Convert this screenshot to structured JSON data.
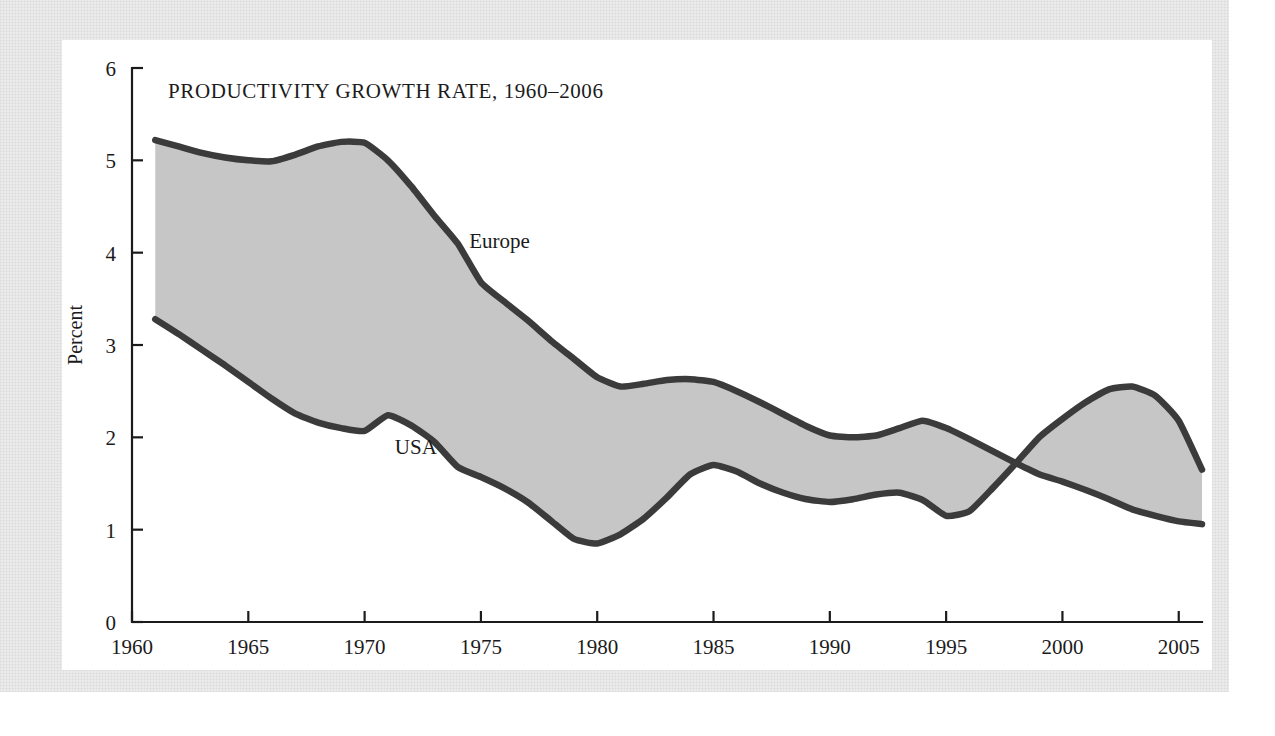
{
  "figure": {
    "title": "PRODUCTIVITY GROWTH RATE, 1960–2006",
    "y_axis_title": "Percent",
    "series_labels": {
      "europe": "Europe",
      "usa": "USA"
    },
    "colors": {
      "page_background": "#ffffff",
      "paper_panel": "#ebebeb",
      "figure_card": "#ffffff",
      "band_fill": "#c6c6c6",
      "line": "#3b3b3b",
      "text": "#1b1b1b"
    }
  },
  "chart_data": {
    "type": "area",
    "title": "PRODUCTIVITY GROWTH RATE, 1960–2006",
    "xlabel": "",
    "ylabel": "Percent",
    "xlim": [
      1960,
      2006
    ],
    "ylim": [
      0,
      6
    ],
    "grid": false,
    "legend": "inline-labels",
    "xticks": [
      1960,
      1965,
      1970,
      1975,
      1980,
      1985,
      1990,
      1995,
      2000,
      2005
    ],
    "xtick_labels": [
      "1960",
      "1965",
      "1970",
      "1975",
      "1980",
      "1985",
      "1990",
      "1995",
      "2000",
      "2005"
    ],
    "yticks": [
      0,
      1,
      2,
      3,
      4,
      5,
      6
    ],
    "ytick_labels": [
      "0",
      "1",
      "2",
      "3",
      "4",
      "5",
      "6"
    ],
    "annotations": [
      {
        "text": "Europe",
        "x": 1974.5,
        "y": 4.05
      },
      {
        "text": "USA",
        "x": 1971.3,
        "y": 1.82
      }
    ],
    "shaded_band": {
      "between": [
        "Europe",
        "USA"
      ],
      "fill": "#c6c6c6",
      "note": "area between the two curves is shaded gray; curves cross near 1997"
    },
    "x": [
      1961,
      1962,
      1963,
      1964,
      1965,
      1966,
      1967,
      1968,
      1969,
      1970,
      1971,
      1972,
      1973,
      1974,
      1975,
      1976,
      1977,
      1978,
      1979,
      1980,
      1981,
      1982,
      1983,
      1984,
      1985,
      1986,
      1987,
      1988,
      1989,
      1990,
      1991,
      1992,
      1993,
      1994,
      1995,
      1996,
      1997,
      1998,
      1999,
      2000,
      2001,
      2002,
      2003,
      2004,
      2005,
      2006
    ],
    "series": [
      {
        "name": "Europe",
        "values": [
          5.22,
          5.15,
          5.08,
          5.03,
          5.0,
          4.99,
          5.06,
          5.15,
          5.2,
          5.19,
          5.0,
          4.72,
          4.4,
          4.1,
          3.68,
          3.47,
          3.27,
          3.05,
          2.85,
          2.65,
          2.55,
          2.58,
          2.62,
          2.63,
          2.6,
          2.5,
          2.38,
          2.25,
          2.12,
          2.02,
          2.0,
          2.02,
          2.1,
          2.18,
          2.1,
          1.98,
          1.85,
          1.72,
          1.6,
          1.52,
          1.43,
          1.33,
          1.22,
          1.15,
          1.09,
          1.06
        ]
      },
      {
        "name": "USA",
        "values": [
          3.28,
          3.12,
          2.95,
          2.78,
          2.6,
          2.42,
          2.26,
          2.16,
          2.1,
          2.07,
          2.24,
          2.13,
          1.95,
          1.68,
          1.57,
          1.45,
          1.3,
          1.1,
          0.9,
          0.85,
          0.95,
          1.12,
          1.35,
          1.6,
          1.7,
          1.63,
          1.5,
          1.4,
          1.33,
          1.3,
          1.33,
          1.38,
          1.4,
          1.32,
          1.15,
          1.2,
          1.45,
          1.72,
          2.0,
          2.2,
          2.38,
          2.52,
          2.55,
          2.45,
          2.18,
          1.65
        ]
      }
    ]
  }
}
